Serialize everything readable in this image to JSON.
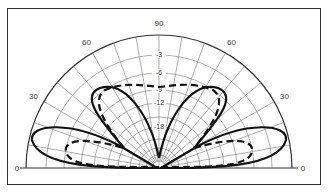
{
  "chart_data": {
    "type": "polar",
    "title": "",
    "angle_labels": [
      {
        "text": "0",
        "angle": 0
      },
      {
        "text": "30",
        "angle": 30
      },
      {
        "text": "60",
        "angle": 60
      },
      {
        "text": "90",
        "angle": 90
      },
      {
        "text": "60",
        "angle": 120
      },
      {
        "text": "30",
        "angle": 150
      },
      {
        "text": "0",
        "angle": 180
      }
    ],
    "db_labels": [
      "-3",
      "-6",
      "-9",
      "-12",
      "-18"
    ],
    "radial_range_db": [
      -30,
      0
    ],
    "grid": true,
    "series": [
      {
        "name": "solid",
        "style": "solid",
        "lobes": [
          {
            "peak_elevation_deg": 8,
            "peak_db": 0
          },
          {
            "peak_elevation_deg": 55,
            "peak_db": -8
          },
          {
            "peak_elevation_deg": 125,
            "peak_db": -8
          },
          {
            "peak_elevation_deg": 172,
            "peak_db": 0
          }
        ],
        "null_deg": 90
      },
      {
        "name": "dashed",
        "style": "dashed",
        "lobes": [
          {
            "peak_elevation_deg": 10,
            "peak_db": -4
          },
          {
            "peak_elevation_deg": 60,
            "peak_db": -8
          },
          {
            "peak_elevation_deg": 90,
            "peak_db": -9
          },
          {
            "peak_elevation_deg": 120,
            "peak_db": -8
          },
          {
            "peak_elevation_deg": 170,
            "peak_db": -4
          }
        ]
      }
    ]
  }
}
